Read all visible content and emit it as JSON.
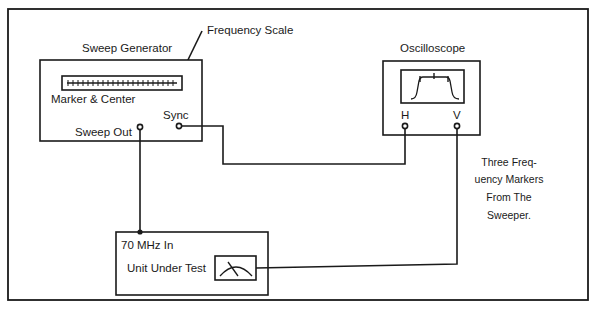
{
  "diagram": {
    "sweep_generator": {
      "title": "Sweep Generator",
      "scale_label": "Frequency Scale",
      "marker_label": "Marker & Center",
      "sync_label": "Sync",
      "sweep_out_label": "Sweep Out"
    },
    "oscilloscope": {
      "title": "Oscilloscope",
      "h_label": "H",
      "v_label": "V"
    },
    "unit_under_test": {
      "input_label": "70 MHz In",
      "title": "Unit Under Test"
    },
    "note": {
      "lines": [
        "Three Freq-",
        "uency Markers",
        "From The",
        "Sweeper."
      ]
    },
    "connections": [
      {
        "from": "Sweep Generator Sync",
        "to": "Oscilloscope H"
      },
      {
        "from": "Sweep Generator Sweep Out",
        "to": "Unit Under Test 70 MHz In"
      },
      {
        "from": "Unit Under Test meter",
        "to": "Oscilloscope V"
      }
    ]
  }
}
